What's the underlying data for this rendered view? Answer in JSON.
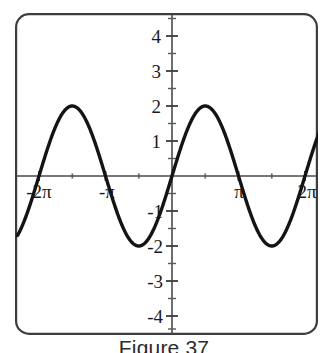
{
  "caption": "Figure 37",
  "colors": {
    "curve": "#141414",
    "axis": "#4a4a4a",
    "frame": "#3d3d3d",
    "text": "#1a1a1a",
    "background": "#ffffff"
  },
  "chart_data": {
    "type": "line",
    "title": "",
    "subtitle": "",
    "xlabel": "",
    "ylabel": "",
    "function": "y = 2 sin(x)",
    "amplitude": 2,
    "period": "2π",
    "xlim": [
      -7.3,
      7.3
    ],
    "ylim": [
      -4.6,
      4.6
    ],
    "grid": false,
    "legend": false,
    "legend_position": "none",
    "x_tick_labels": [
      "-2π",
      "-π",
      "π",
      "2π"
    ],
    "x_tick_values": [
      -6.2832,
      -3.1416,
      3.1416,
      6.2832
    ],
    "x_minor_tick_values": [
      -4.7124,
      -1.5708,
      1.5708,
      4.7124
    ],
    "y_tick_labels": [
      "4",
      "3",
      "2",
      "1",
      "-1",
      "-2",
      "-3",
      "-4"
    ],
    "y_tick_values": [
      4,
      3,
      2,
      1,
      -1,
      -2,
      -3,
      -4
    ],
    "y_minor_tick_values": [
      4.5,
      3.5,
      2.5,
      1.5,
      0.5,
      -0.5,
      -1.5,
      -2.5,
      -3.5,
      -4.5
    ],
    "key_points": [
      {
        "x": -6.2832,
        "y": 0,
        "kind": "zero-crossing",
        "label": "-2π"
      },
      {
        "x": -4.7124,
        "y": 2,
        "kind": "maximum"
      },
      {
        "x": -3.1416,
        "y": 0,
        "kind": "zero-crossing",
        "label": "-π"
      },
      {
        "x": -1.5708,
        "y": -2,
        "kind": "minimum"
      },
      {
        "x": 0,
        "y": 0,
        "kind": "zero-crossing",
        "label": "0"
      },
      {
        "x": 1.5708,
        "y": 2,
        "kind": "maximum"
      },
      {
        "x": 3.1416,
        "y": 0,
        "kind": "zero-crossing",
        "label": "π"
      },
      {
        "x": 4.7124,
        "y": -2,
        "kind": "minimum"
      },
      {
        "x": 6.2832,
        "y": 0,
        "kind": "zero-crossing",
        "label": "2π"
      }
    ],
    "endpoints": [
      {
        "x": -7.3,
        "y": -1.64
      },
      {
        "x": 7.3,
        "y": 1.64
      }
    ]
  }
}
